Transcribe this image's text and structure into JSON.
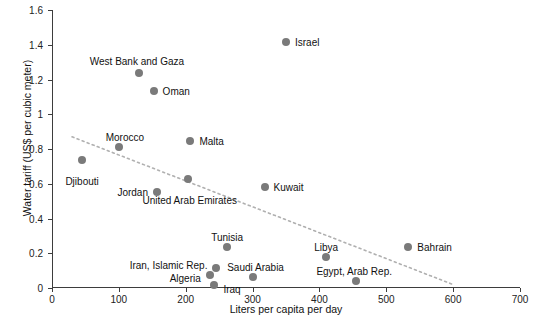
{
  "chart_data": {
    "type": "scatter",
    "title": "",
    "xlabel": "Liters per capita per day",
    "ylabel": "Water tariff (US$ per cubic meter)",
    "xlim": [
      0,
      700
    ],
    "ylim": [
      0,
      1.6
    ],
    "xticks": [
      "0",
      "100",
      "200",
      "300",
      "400",
      "500",
      "600",
      "700"
    ],
    "yticks": [
      "0",
      "0.2",
      "0.4",
      "0.6",
      "0.8",
      "1",
      "1.2",
      "1.4",
      "1.6"
    ],
    "grid": false,
    "legend": "none",
    "marker_color": "#7a7a7a",
    "trendline": {
      "style": "dotted",
      "color": "#b0b0b0",
      "x0": 30,
      "y0": 0.87,
      "x1": 600,
      "y1": 0.02
    },
    "points": [
      {
        "name": "Djibouti",
        "x": 45,
        "y": 0.735,
        "label_pos": "below-center",
        "label_dx": 0,
        "label_dy": 16
      },
      {
        "name": "West Bank and Gaza",
        "x": 130,
        "y": 1.235,
        "label_pos": "above-center",
        "label_dx": -2,
        "label_dy": -17
      },
      {
        "name": "Oman",
        "x": 152,
        "y": 1.135,
        "label_pos": "right",
        "label_dx": 9,
        "label_dy": 0
      },
      {
        "name": "Morocco",
        "x": 100,
        "y": 0.81,
        "label_pos": "above-center",
        "label_dx": 6,
        "label_dy": -15
      },
      {
        "name": "Malta",
        "x": 207,
        "y": 0.845,
        "label_pos": "right",
        "label_dx": 9,
        "label_dy": 0
      },
      {
        "name": "Jordan",
        "x": 157,
        "y": 0.555,
        "label_pos": "left",
        "label_dx": -9,
        "label_dy": 0
      },
      {
        "name": "United Arab Emirates",
        "x": 203,
        "y": 0.625,
        "label_pos": "below-center",
        "label_dx": 2,
        "label_dy": 16
      },
      {
        "name": "Kuwait",
        "x": 318,
        "y": 0.58,
        "label_pos": "right",
        "label_dx": 9,
        "label_dy": 0
      },
      {
        "name": "Israel",
        "x": 350,
        "y": 1.415,
        "label_pos": "right",
        "label_dx": 9,
        "label_dy": 0
      },
      {
        "name": "Tunisia",
        "x": 262,
        "y": 0.235,
        "label_pos": "above-center",
        "label_dx": 0,
        "label_dy": -15
      },
      {
        "name": "Saudi Arabia",
        "x": 300,
        "y": 0.065,
        "label_pos": "above-center",
        "label_dx": 3,
        "label_dy": -15
      },
      {
        "name": "Iran, Islamic Rep.",
        "x": 246,
        "y": 0.115,
        "label_pos": "left",
        "label_dx": -9,
        "label_dy": -3
      },
      {
        "name": "Algeria",
        "x": 236,
        "y": 0.075,
        "label_pos": "left",
        "label_dx": -9,
        "label_dy": 3
      },
      {
        "name": "Iraq",
        "x": 243,
        "y": 0.02,
        "label_pos": "right",
        "label_dx": 9,
        "label_dy": 4
      },
      {
        "name": "Libya",
        "x": 410,
        "y": 0.18,
        "label_pos": "above-center",
        "label_dx": 0,
        "label_dy": -15
      },
      {
        "name": "Egypt, Arab Rep.",
        "x": 455,
        "y": 0.04,
        "label_pos": "above-center",
        "label_dx": -2,
        "label_dy": -15
      },
      {
        "name": "Bahrain",
        "x": 533,
        "y": 0.235,
        "label_pos": "right",
        "label_dx": 9,
        "label_dy": 0
      }
    ]
  }
}
